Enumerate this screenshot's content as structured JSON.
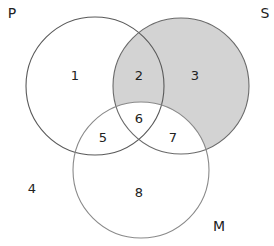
{
  "diagram": {
    "type": "venn-3-set",
    "sets": [
      {
        "id": "P",
        "label": "P",
        "cx": 95,
        "cy": 86,
        "r": 69,
        "stroke": "#5a5a5a"
      },
      {
        "id": "S",
        "label": "S",
        "cx": 181,
        "cy": 86,
        "r": 68,
        "stroke": "#6a6a6a"
      },
      {
        "id": "M",
        "label": "M",
        "cx": 141,
        "cy": 170,
        "r": 68,
        "stroke": "#8a8a8a"
      }
    ],
    "set_labels": {
      "P": {
        "text": "P",
        "x": 12,
        "y": 18
      },
      "S": {
        "text": "S",
        "x": 265,
        "y": 18
      },
      "M": {
        "text": "M",
        "x": 219,
        "y": 231
      }
    },
    "regions": [
      {
        "id": "1",
        "label": "1",
        "x": 75,
        "y": 80,
        "shaded": false,
        "membership": "P only"
      },
      {
        "id": "2",
        "label": "2",
        "x": 139,
        "y": 80,
        "shaded": true,
        "membership": "P and S, not M"
      },
      {
        "id": "3",
        "label": "3",
        "x": 195,
        "y": 80,
        "shaded": true,
        "membership": "S only"
      },
      {
        "id": "4",
        "label": "4",
        "x": 32,
        "y": 193,
        "shaded": false,
        "membership": "none"
      },
      {
        "id": "5",
        "label": "5",
        "x": 103,
        "y": 142,
        "shaded": false,
        "membership": "P and M, not S"
      },
      {
        "id": "6",
        "label": "6",
        "x": 139,
        "y": 123,
        "shaded": false,
        "membership": "P, S and M"
      },
      {
        "id": "7",
        "label": "7",
        "x": 173,
        "y": 142,
        "shaded": false,
        "membership": "S and M, not P"
      },
      {
        "id": "8",
        "label": "8",
        "x": 139,
        "y": 197,
        "shaded": false,
        "membership": "M only"
      }
    ],
    "shaded_area": "S minus M",
    "colors": {
      "shade": "#d3d3d3",
      "background": "#ffffff",
      "text": "#222222"
    }
  }
}
